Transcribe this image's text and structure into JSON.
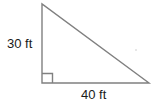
{
  "figure": {
    "type": "right-triangle-diagram",
    "background_color": "#ffffff",
    "stroke_color": "#808080",
    "text_color": "#1a1a1a",
    "labels": {
      "vertical_leg": "30 ft",
      "horizontal_leg": "40 ft"
    },
    "geometry": {
      "apex": [
        42,
        4
      ],
      "right_angle_vertex": [
        42,
        83
      ],
      "right_vertex": [
        149,
        83
      ],
      "right_angle_marker_size": 10
    },
    "icons": {
      "right_angle_marker": "right-angle-icon"
    }
  }
}
